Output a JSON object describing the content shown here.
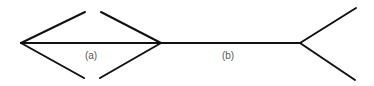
{
  "diagram": {
    "title": "",
    "stroke_color": "#111111",
    "label_color": "#555555",
    "labels": {
      "a": "(a)",
      "b": "(b)"
    },
    "figures": [
      {
        "id": "a",
        "description": "Shaft with inward-pointing arrowheads at both ends",
        "shaft": [
          21,
          43,
          161,
          43
        ],
        "arms": [
          [
            21,
            43,
            85,
            12
          ],
          [
            21,
            43,
            84,
            78
          ],
          [
            161,
            43,
            101,
            12
          ],
          [
            161,
            43,
            100,
            78
          ]
        ],
        "label_pos": [
          91,
          55
        ]
      },
      {
        "id": "b",
        "description": "Shaft ending in an outward-pointing fork",
        "shaft": [
          161,
          43,
          300,
          43
        ],
        "arms": [
          [
            300,
            43,
            356,
            8
          ],
          [
            300,
            43,
            355,
            80
          ]
        ],
        "label_pos": [
          228,
          55
        ]
      }
    ]
  }
}
